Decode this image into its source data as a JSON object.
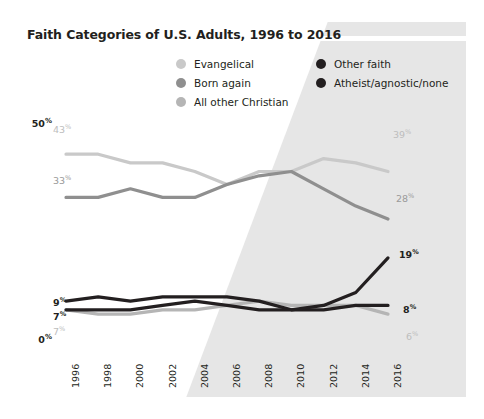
{
  "title": "Faith Categories of U.S. Adults, 1996 to 2016",
  "legend": {
    "columns": [
      {
        "items": [
          {
            "label": "Evangelical",
            "color": "#c9c9c9",
            "icon": "legend-dot-icon"
          },
          {
            "label": "Born again",
            "color": "#8f8f8f",
            "icon": "legend-dot-icon"
          },
          {
            "label": "All other Christian",
            "color": "#b5b5b5",
            "icon": "legend-dot-icon"
          }
        ]
      },
      {
        "items": [
          {
            "label": "Other faith",
            "color": "#231f20",
            "icon": "legend-dot-icon"
          },
          {
            "label": "Atheist/agnostic/none",
            "color": "#231f20",
            "icon": "legend-dot-icon"
          }
        ]
      }
    ]
  },
  "axis": {
    "y_ticks": [
      {
        "value": 50,
        "text": "50",
        "unit": "%"
      },
      {
        "value": 0,
        "text": "0",
        "unit": "%"
      }
    ],
    "x_ticks": [
      "1996",
      "1998",
      "2000",
      "2002",
      "2004",
      "2006",
      "2008",
      "2010",
      "2012",
      "2014",
      "2016"
    ]
  },
  "end_labels": {
    "evangelical_start": "43",
    "evangelical_end": "39",
    "born_again_start": "33",
    "born_again_end": "28",
    "other_faith_start": "9",
    "other_faith_end": "8",
    "atheist_start": "7",
    "atheist_end": "19",
    "all_other_christian_start": "7",
    "all_other_christian_end": "6",
    "unit": "%"
  },
  "colors": {
    "background": "#ffffff",
    "shade": "#e6e6e6",
    "evangelical": "#c9c9c9",
    "born_again": "#8f8f8f",
    "all_other_christian": "#b5b5b5",
    "other_faith": "#231f20",
    "atheist": "#231f20",
    "text": "#231f20"
  },
  "chart_data": {
    "type": "line",
    "title": "Faith Categories of U.S. Adults, 1996 to 2016",
    "xlabel": "",
    "ylabel": "",
    "ylim": [
      0,
      50
    ],
    "grid": false,
    "legend_position": "top",
    "x": [
      1996,
      1998,
      2000,
      2002,
      2004,
      2006,
      2008,
      2010,
      2012,
      2014,
      2016
    ],
    "categories": [
      "1996",
      "1998",
      "2000",
      "2002",
      "2004",
      "2006",
      "2008",
      "2010",
      "2012",
      "2014",
      "2016"
    ],
    "series": [
      {
        "name": "Evangelical",
        "color": "#c9c9c9",
        "values": [
          43,
          43,
          41,
          41,
          39,
          36,
          39,
          39,
          42,
          41,
          39
        ],
        "labels": {
          "first": "43%",
          "last": "39%"
        }
      },
      {
        "name": "Born again",
        "color": "#8f8f8f",
        "values": [
          33,
          33,
          35,
          33,
          33,
          36,
          38,
          39,
          35,
          31,
          28
        ],
        "labels": {
          "first": "33%",
          "last": "28%"
        }
      },
      {
        "name": "All other Christian",
        "color": "#b5b5b5",
        "values": [
          7,
          6,
          6,
          7,
          7,
          8,
          9,
          8,
          8,
          8,
          6
        ],
        "labels": {
          "first": "7%",
          "last": "6%"
        }
      },
      {
        "name": "Other faith",
        "color": "#231f20",
        "values": [
          9,
          10,
          9,
          10,
          10,
          10,
          9,
          7,
          7,
          8,
          8
        ],
        "labels": {
          "first": "9%",
          "last": "8%"
        }
      },
      {
        "name": "Atheist/agnostic/none",
        "color": "#231f20",
        "values": [
          7,
          7,
          7,
          8,
          9,
          8,
          7,
          7,
          8,
          11,
          19
        ],
        "labels": {
          "first": "7%",
          "last": "19%"
        }
      }
    ],
    "annotations": [
      {
        "text": "43%",
        "series": "Evangelical",
        "x": 1996
      },
      {
        "text": "39%",
        "series": "Evangelical",
        "x": 2016
      },
      {
        "text": "33%",
        "series": "Born again",
        "x": 1996
      },
      {
        "text": "28%",
        "series": "Born again",
        "x": 2016
      },
      {
        "text": "9%",
        "series": "Other faith",
        "x": 1996
      },
      {
        "text": "8%",
        "series": "Other faith",
        "x": 2016
      },
      {
        "text": "7%",
        "series": "Atheist/agnostic/none",
        "x": 1996
      },
      {
        "text": "19%",
        "series": "Atheist/agnostic/none",
        "x": 2016
      },
      {
        "text": "7%",
        "series": "All other Christian",
        "x": 1996
      },
      {
        "text": "6%",
        "series": "All other Christian",
        "x": 2016
      }
    ]
  }
}
